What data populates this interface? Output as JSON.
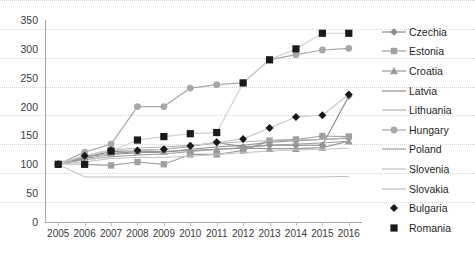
{
  "chart_data": {
    "type": "line",
    "title": "",
    "xlabel": "",
    "ylabel": "",
    "categories": [
      "2005",
      "2006",
      "2007",
      "2008",
      "2009",
      "2010",
      "2011",
      "2012",
      "2013",
      "2014",
      "2015",
      "2016"
    ],
    "x": [
      2005,
      2006,
      2007,
      2008,
      2009,
      2010,
      2011,
      2012,
      2013,
      2014,
      2015,
      2016
    ],
    "ylim": [
      0,
      350
    ],
    "ytick_step": 50,
    "yticks": [
      0,
      50,
      100,
      150,
      200,
      250,
      300,
      350
    ],
    "grid": true,
    "legend_position": "right",
    "series": [
      {
        "name": "Czechia",
        "marker": "diamond",
        "color": "#8c8c8c",
        "values": [
          100,
          112,
          122,
          124,
          126,
          131,
          138,
          130,
          133,
          133,
          133,
          218
        ]
      },
      {
        "name": "Estonia",
        "marker": "square",
        "color": "#a0a0a0",
        "values": [
          100,
          100,
          98,
          104,
          100,
          117,
          117,
          124,
          141,
          143,
          149,
          148
        ]
      },
      {
        "name": "Croatia",
        "marker": "triangle",
        "color": "#9a9a9a",
        "values": [
          100,
          113,
          119,
          122,
          122,
          124,
          126,
          128,
          127,
          127,
          129,
          140
        ]
      },
      {
        "name": "Latvia",
        "marker": "none",
        "color": "#8f8f8f",
        "values": [
          100,
          110,
          117,
          120,
          121,
          126,
          130,
          133,
          138,
          141,
          143,
          145
        ]
      },
      {
        "name": "Lithuania",
        "marker": "none",
        "color": "#b3b3b3",
        "values": [
          100,
          115,
          125,
          128,
          130,
          133,
          136,
          139,
          141,
          142,
          143,
          146
        ]
      },
      {
        "name": "Hungary",
        "marker": "circle",
        "color": "#a8a8a8",
        "values": [
          100,
          121,
          135,
          200,
          200,
          232,
          238,
          241,
          281,
          290,
          298,
          301
        ]
      },
      {
        "name": "Poland",
        "marker": "none",
        "color": "#9c9c9c",
        "values": [
          100,
          108,
          113,
          116,
          118,
          122,
          126,
          129,
          133,
          135,
          137,
          140
        ]
      },
      {
        "name": "Slovenia",
        "marker": "none",
        "color": "#c2c2c2",
        "values": [
          100,
          104,
          110,
          112,
          112,
          114,
          117,
          120,
          123,
          125,
          126,
          128
        ]
      },
      {
        "name": "Slovakia",
        "marker": "none",
        "color": "#bdbdbd",
        "values": [
          100,
          78,
          78,
          78,
          78,
          78,
          78,
          78,
          78,
          78,
          78,
          79
        ]
      },
      {
        "name": "Bulgaria",
        "marker": "diamond-filled",
        "color": "#c9c9c9",
        "values": [
          100,
          115,
          124,
          124,
          126,
          132,
          138,
          144,
          163,
          182,
          185,
          221
        ]
      },
      {
        "name": "Romania",
        "marker": "square-filled",
        "color": "#d0d0d0",
        "values": [
          100,
          100,
          123,
          142,
          148,
          153,
          155,
          241,
          281,
          300,
          327,
          327
        ]
      }
    ]
  },
  "legend": {
    "items": [
      {
        "label": "Czechia"
      },
      {
        "label": "Estonia"
      },
      {
        "label": "Croatia"
      },
      {
        "label": "Latvia"
      },
      {
        "label": "Lithuania"
      },
      {
        "label": "Hungary"
      },
      {
        "label": "Poland"
      },
      {
        "label": "Slovenia"
      },
      {
        "label": "Slovakia"
      },
      {
        "label": "Bulgaria"
      },
      {
        "label": "Romania"
      }
    ]
  }
}
